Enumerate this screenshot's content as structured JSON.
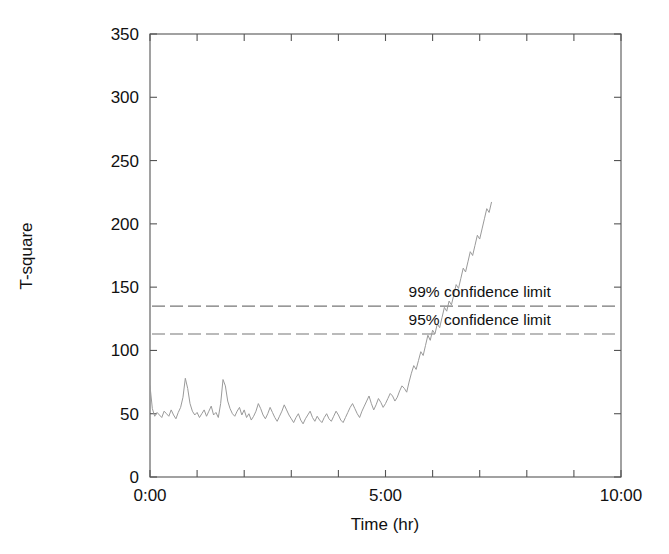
{
  "chart_data": {
    "type": "line",
    "title": "",
    "xlabel": "Time (hr)",
    "ylabel": "T-square",
    "xlim": [
      0,
      10
    ],
    "ylim": [
      0,
      350
    ],
    "grid": false,
    "legend": "none",
    "x_tick_labels": [
      "0:00",
      "5:00",
      "10:00"
    ],
    "x_tick_values": [
      0,
      5,
      10
    ],
    "x_minor_tick_values": [
      1,
      2,
      3,
      4,
      6,
      7,
      8,
      9
    ],
    "y_tick_labels": [
      "0",
      "50",
      "100",
      "150",
      "200",
      "250",
      "300",
      "350"
    ],
    "y_tick_values": [
      0,
      50,
      100,
      150,
      200,
      250,
      300,
      350
    ],
    "annotations": [
      {
        "name": "99% confidence limit",
        "label": "99% confidence limit",
        "value": 135,
        "style": "dashed-horizontal-line",
        "label_x": 7.0,
        "color": "#777777"
      },
      {
        "name": "95% confidence limit",
        "label": "95% confidence limit",
        "value": 113,
        "style": "dashed-horizontal-line",
        "label_x": 7.0,
        "color": "#777777"
      }
    ],
    "series": [
      {
        "name": "T-square statistic",
        "color": "#9a9a9a",
        "x": [
          0.0,
          0.05,
          0.1,
          0.15,
          0.2,
          0.25,
          0.3,
          0.35,
          0.4,
          0.45,
          0.5,
          0.55,
          0.6,
          0.65,
          0.7,
          0.75,
          0.8,
          0.85,
          0.9,
          0.95,
          1.0,
          1.05,
          1.1,
          1.15,
          1.2,
          1.25,
          1.3,
          1.35,
          1.4,
          1.45,
          1.5,
          1.55,
          1.6,
          1.65,
          1.7,
          1.75,
          1.8,
          1.85,
          1.9,
          1.95,
          2.0,
          2.05,
          2.1,
          2.15,
          2.2,
          2.25,
          2.3,
          2.35,
          2.4,
          2.45,
          2.5,
          2.55,
          2.6,
          2.65,
          2.7,
          2.75,
          2.8,
          2.85,
          2.9,
          2.95,
          3.0,
          3.05,
          3.1,
          3.15,
          3.2,
          3.25,
          3.3,
          3.35,
          3.4,
          3.45,
          3.5,
          3.55,
          3.6,
          3.65,
          3.7,
          3.75,
          3.8,
          3.85,
          3.9,
          3.95,
          4.0,
          4.05,
          4.1,
          4.15,
          4.2,
          4.25,
          4.3,
          4.35,
          4.4,
          4.45,
          4.5,
          4.55,
          4.6,
          4.65,
          4.7,
          4.75,
          4.8,
          4.85,
          4.9,
          4.95,
          5.0,
          5.05,
          5.1,
          5.15,
          5.2,
          5.25,
          5.3,
          5.35,
          5.4,
          5.45,
          5.5,
          5.55,
          5.6,
          5.65,
          5.7,
          5.75,
          5.8,
          5.85,
          5.9,
          5.95,
          6.0,
          6.05,
          6.1,
          6.15,
          6.2,
          6.25,
          6.3,
          6.35,
          6.4,
          6.45,
          6.5,
          6.55,
          6.6,
          6.65,
          6.7,
          6.75,
          6.8,
          6.85,
          6.9,
          6.95,
          7.0,
          7.05,
          7.1,
          7.15,
          7.2,
          7.25
        ],
        "y": [
          72,
          54,
          48,
          51,
          49,
          47,
          52,
          50,
          48,
          53,
          49,
          46,
          51,
          55,
          63,
          78,
          70,
          58,
          52,
          49,
          51,
          47,
          50,
          53,
          48,
          52,
          56,
          49,
          51,
          47,
          58,
          77,
          72,
          60,
          54,
          50,
          48,
          52,
          55,
          49,
          53,
          47,
          50,
          45,
          48,
          52,
          58,
          54,
          49,
          46,
          50,
          55,
          51,
          47,
          44,
          48,
          52,
          57,
          53,
          49,
          46,
          43,
          47,
          50,
          45,
          42,
          46,
          49,
          52,
          47,
          44,
          48,
          45,
          43,
          47,
          50,
          46,
          44,
          48,
          52,
          49,
          45,
          43,
          47,
          51,
          55,
          58,
          54,
          50,
          47,
          52,
          56,
          60,
          64,
          58,
          53,
          57,
          62,
          59,
          55,
          58,
          62,
          66,
          64,
          60,
          63,
          68,
          72,
          70,
          67,
          75,
          82,
          88,
          85,
          92,
          99,
          96,
          104,
          112,
          108,
          116,
          113,
          121,
          118,
          126,
          134,
          131,
          139,
          136,
          144,
          152,
          149,
          157,
          165,
          162,
          170,
          178,
          175,
          183,
          191,
          188,
          196,
          204,
          212,
          209,
          217
        ]
      }
    ]
  },
  "axes": {
    "x_title": "Time (hr)",
    "y_title": "T-square"
  }
}
